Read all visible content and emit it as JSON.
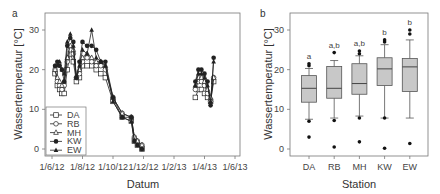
{
  "chart_data": [
    {
      "panel": "a",
      "type": "line",
      "xlabel": "Datum",
      "ylabel": "Wassertemperatur [°C]",
      "ylim": [
        -1,
        33
      ],
      "yticks": [
        0,
        10,
        20,
        30
      ],
      "xticks": [
        "1/6/12",
        "1/8/12",
        "1/10/12",
        "1/12/12",
        "1/2/13",
        "1/4/13",
        "1/6/13"
      ],
      "grid": false,
      "legend_position": "lower-left",
      "series": [
        {
          "name": "DA",
          "marker": "open-square",
          "x": [
            0.2,
            0.35,
            0.5,
            0.65,
            0.8,
            1.0,
            1.2,
            1.4,
            1.6,
            1.8,
            2.0,
            2.3,
            2.6,
            2.9,
            3.2,
            3.5,
            4.0,
            4.6,
            5.2,
            5.4,
            5.6,
            5.9,
            9.4,
            9.6,
            9.8,
            10.0,
            10.2,
            10.4,
            10.6
          ],
          "y": [
            19,
            16,
            15,
            14,
            14,
            20,
            24,
            22,
            17,
            18,
            21,
            21,
            21,
            20,
            19,
            18,
            12,
            8,
            7,
            2,
            1,
            0,
            13,
            15,
            15,
            14,
            13,
            12,
            17
          ]
        },
        {
          "name": "RB",
          "marker": "open-circle",
          "x": [
            0.2,
            0.35,
            0.5,
            0.65,
            0.8,
            1.0,
            1.2,
            1.4,
            1.6,
            1.8,
            2.0,
            2.3,
            2.6,
            2.9,
            3.2,
            3.5,
            4.0,
            4.6,
            5.2,
            5.4,
            5.6,
            5.9,
            9.4,
            9.6,
            9.8,
            10.0,
            10.2,
            10.4,
            10.6
          ],
          "y": [
            20,
            17,
            16,
            15,
            16,
            22,
            25,
            24,
            18,
            19,
            22,
            23,
            22,
            21,
            21,
            20,
            13,
            9,
            8,
            3,
            2,
            1,
            15,
            17,
            17,
            16,
            14,
            12,
            18
          ]
        },
        {
          "name": "MH",
          "marker": "open-triangle",
          "x": [
            0.2,
            0.35,
            0.5,
            0.65,
            0.8,
            1.0,
            1.2,
            1.4,
            1.6,
            1.8,
            2.0,
            2.3,
            2.6,
            2.9,
            3.2,
            3.5,
            4.0,
            4.6,
            5.2,
            5.4,
            5.6,
            5.9,
            9.4,
            9.6,
            9.8,
            10.0,
            10.2,
            10.4,
            10.6
          ],
          "y": [
            20,
            18,
            17,
            16,
            17,
            23,
            26,
            25,
            18,
            20,
            23,
            24,
            23,
            22,
            22,
            21,
            13,
            9,
            8,
            3,
            2,
            1,
            16,
            18,
            18,
            17,
            15,
            13,
            18
          ]
        },
        {
          "name": "KW",
          "marker": "filled-circle",
          "x": [
            0.2,
            0.35,
            0.5,
            0.65,
            0.8,
            1.0,
            1.2,
            1.4,
            1.6,
            1.8,
            2.0,
            2.3,
            2.6,
            2.9,
            3.2,
            3.5,
            4.0,
            4.6,
            5.2,
            5.4,
            5.6,
            5.9,
            9.4,
            9.6,
            9.8,
            10.0,
            10.2,
            10.4,
            10.6
          ],
          "y": [
            21,
            22,
            21,
            20,
            17,
            26,
            28,
            27,
            18,
            22,
            27,
            26,
            26,
            25,
            22,
            22,
            13,
            8,
            8,
            2,
            1,
            0,
            17,
            20,
            20,
            19,
            17,
            11,
            23
          ]
        },
        {
          "name": "EW",
          "marker": "filled-triangle",
          "x": [
            0.2,
            0.35,
            0.5,
            0.65,
            0.8,
            1.0,
            1.2,
            1.4,
            1.6,
            1.8,
            2.0,
            2.3,
            2.6,
            2.9,
            3.2,
            3.5,
            4.0,
            4.6,
            5.2,
            5.4,
            5.6,
            5.9,
            9.4,
            9.6,
            9.8,
            10.0,
            10.2,
            10.4,
            10.6
          ],
          "y": [
            21,
            21,
            22,
            20,
            19,
            27,
            29,
            26,
            18,
            21,
            25,
            24,
            30,
            23,
            22,
            21,
            12,
            8,
            7,
            2,
            1,
            0,
            16,
            19,
            19,
            18,
            16,
            12,
            22
          ]
        }
      ]
    },
    {
      "panel": "b",
      "type": "box",
      "xlabel": "Station",
      "ylabel": "Wassertemperatur [°C]",
      "ylim": [
        -1,
        33
      ],
      "yticks": [
        0,
        10,
        20,
        30
      ],
      "grid": false,
      "categories": [
        "DA",
        "RB",
        "MH",
        "KW",
        "EW"
      ],
      "boxes": [
        {
          "name": "DA",
          "whisker_low": 7.5,
          "q1": 11.8,
          "median": 15.3,
          "q3": 18.5,
          "whisker_high": 20.3,
          "outliers": [
            21,
            21.5,
            7,
            3
          ],
          "group": "a"
        },
        {
          "name": "RB",
          "whisker_low": 7.8,
          "q1": 12.8,
          "median": 15.3,
          "q3": 20.8,
          "whisker_high": 22.3,
          "outliers": [
            24.3,
            7.2,
            0.5
          ],
          "group": "a,b"
        },
        {
          "name": "MH",
          "whisker_low": 8.3,
          "q1": 13.8,
          "median": 16.5,
          "q3": 21.5,
          "whisker_high": 23.5,
          "outliers": [
            24,
            24.7,
            7.8,
            1.8
          ],
          "group": "a,b"
        },
        {
          "name": "KW",
          "whisker_low": 7.8,
          "q1": 16,
          "median": 20.2,
          "q3": 23,
          "whisker_high": 26.3,
          "outliers": [
            27,
            27.5,
            7.8,
            0.2
          ],
          "group": "b"
        },
        {
          "name": "EW",
          "whisker_low": 7.8,
          "q1": 14.5,
          "median": 20.7,
          "q3": 22.8,
          "whisker_high": 27.5,
          "outliers": [
            29,
            30,
            1.4
          ],
          "group": "b"
        }
      ]
    }
  ],
  "panels": {
    "a": {
      "label": "a",
      "xlabel": "Datum",
      "ylabel": "Wassertemperatur [°C]",
      "yticks": [
        "0",
        "10",
        "20",
        "30"
      ],
      "xticks": [
        "1/6/12",
        "1/8/12",
        "1/10/12",
        "1/12/12",
        "1/2/13",
        "1/4/13",
        "1/6/13"
      ],
      "legend": [
        "DA",
        "RB",
        "MH",
        "KW",
        "EW"
      ]
    },
    "b": {
      "label": "b",
      "xlabel": "Station",
      "ylabel": "Wassertemperatur [°C]",
      "yticks": [
        "0",
        "10",
        "20",
        "30"
      ],
      "categories": [
        "DA",
        "RB",
        "MH",
        "KW",
        "EW"
      ],
      "groups": [
        "a",
        "a,b",
        "a,b",
        "b",
        "b"
      ]
    }
  },
  "colors": {
    "box_fill": "#c8c8c8",
    "line": "#222222",
    "axis": "#777777"
  }
}
